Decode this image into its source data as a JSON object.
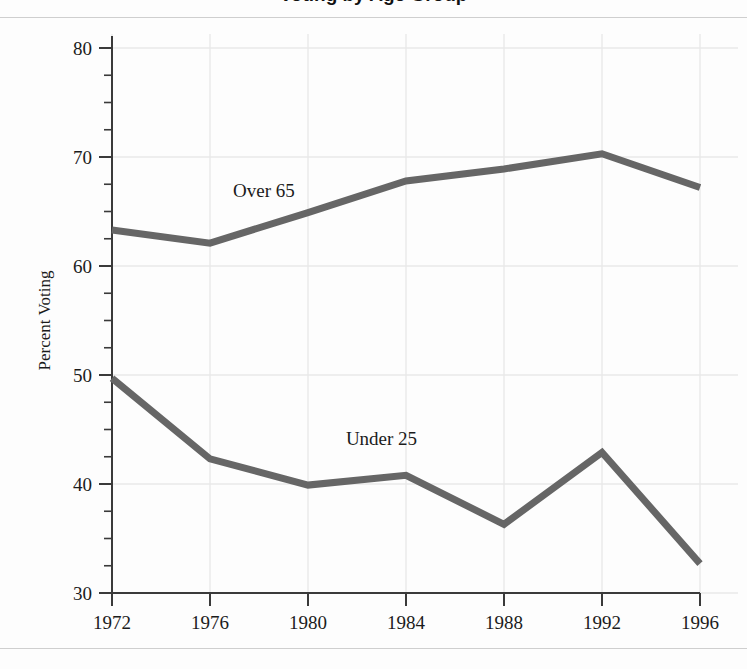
{
  "figure": {
    "title_partial": "Voting by Age Group",
    "ylabel": "Percent Voting"
  },
  "chart_data": {
    "type": "line",
    "title": "Voting by Age Group",
    "xlabel": "",
    "ylabel": "Percent Voting",
    "categories": [
      "1972",
      "1976",
      "1980",
      "1984",
      "1988",
      "1992",
      "1996"
    ],
    "x": [
      1972,
      1976,
      1980,
      1984,
      1988,
      1992,
      1996
    ],
    "xlim": [
      1972,
      1996
    ],
    "ylim": [
      30,
      80
    ],
    "y_major_ticks": [
      30,
      40,
      50,
      60,
      70,
      80
    ],
    "y_minor_tick_step": 2.5,
    "grid": "horizontal-and-vertical-light",
    "legend": "inline-annotations",
    "line_color": "#666666",
    "line_width": 7,
    "series": [
      {
        "name": "Over 65",
        "label": "Over 65",
        "values": [
          63.3,
          62.1,
          64.9,
          67.8,
          68.9,
          70.3,
          67.2
        ],
        "label_x": 1978.2,
        "label_y": 66.3
      },
      {
        "name": "Under 25",
        "label": "Under 25",
        "values": [
          49.7,
          42.3,
          39.9,
          40.8,
          36.3,
          42.9,
          32.7
        ],
        "label_x": 1983.0,
        "label_y": 43.6
      }
    ]
  },
  "axis": {
    "y_tick_labels": [
      "80",
      "70",
      "60",
      "50",
      "40",
      "30"
    ],
    "x_tick_labels": [
      "1972",
      "1976",
      "1980",
      "1984",
      "1988",
      "1992",
      "1996"
    ]
  },
  "colors": {
    "line": "#666666",
    "axis": "#3a3a3a",
    "grid": "#e9e9e9",
    "text": "#1b1b1b",
    "rule": "#cfcfcf",
    "background": "#fdfdfd"
  }
}
